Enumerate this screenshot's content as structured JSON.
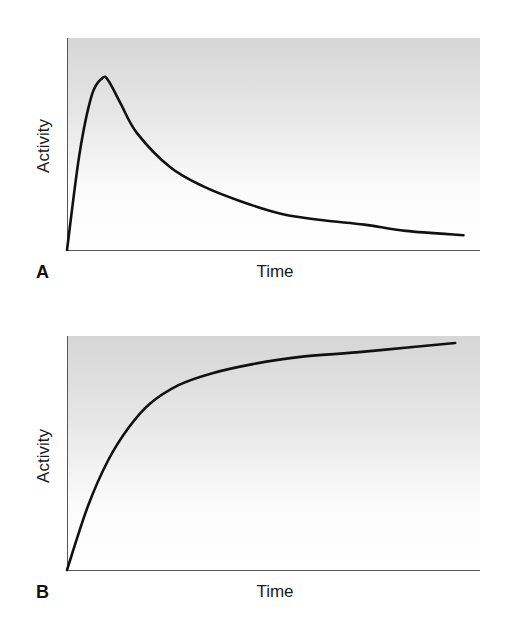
{
  "figure": {
    "panels": [
      {
        "letter": "A",
        "xlabel": "Time",
        "ylabel": "Activity"
      },
      {
        "letter": "B",
        "xlabel": "Time",
        "ylabel": "Activity"
      }
    ]
  },
  "colors": {
    "background": "#ffffff",
    "plot_gradient_top": "#d9d9d9",
    "plot_gradient_bottom": "#ffffff",
    "curve": "#111111",
    "axis": "#555555"
  },
  "chart_data": [
    {
      "type": "line",
      "title": "",
      "panel": "A",
      "xlabel": "Time",
      "ylabel": "Activity",
      "grid": false,
      "ticks": false,
      "xlim": [
        0,
        1
      ],
      "ylim": [
        0,
        1
      ],
      "description": "Rapid rise to a peak, then decay toward a low baseline",
      "x": [
        0.0,
        0.03,
        0.06,
        0.085,
        0.1,
        0.13,
        0.17,
        0.25,
        0.33,
        0.42,
        0.52,
        0.62,
        0.72,
        0.82,
        0.96
      ],
      "y": [
        0.0,
        0.45,
        0.73,
        0.81,
        0.8,
        0.69,
        0.55,
        0.39,
        0.3,
        0.23,
        0.17,
        0.14,
        0.12,
        0.09,
        0.07
      ],
      "series": [
        {
          "name": "Activity",
          "values": [
            0.0,
            0.45,
            0.73,
            0.81,
            0.8,
            0.69,
            0.55,
            0.39,
            0.3,
            0.23,
            0.17,
            0.14,
            0.12,
            0.09,
            0.07
          ]
        }
      ]
    },
    {
      "type": "line",
      "title": "",
      "panel": "B",
      "xlabel": "Time",
      "ylabel": "Activity",
      "grid": false,
      "ticks": false,
      "xlim": [
        0,
        1
      ],
      "ylim": [
        0,
        1
      ],
      "description": "Saturating rise approaching a plateau",
      "x": [
        0.0,
        0.05,
        0.1,
        0.15,
        0.2,
        0.27,
        0.35,
        0.45,
        0.56,
        0.7,
        0.85,
        0.94
      ],
      "y": [
        0.0,
        0.27,
        0.47,
        0.61,
        0.71,
        0.79,
        0.84,
        0.88,
        0.91,
        0.93,
        0.955,
        0.97
      ],
      "series": [
        {
          "name": "Activity",
          "values": [
            0.0,
            0.27,
            0.47,
            0.61,
            0.71,
            0.79,
            0.84,
            0.88,
            0.91,
            0.93,
            0.955,
            0.97
          ]
        }
      ]
    }
  ]
}
